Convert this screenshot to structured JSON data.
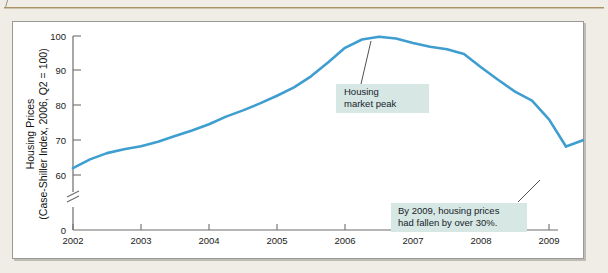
{
  "page": {
    "top_caption": "",
    "background_color": "#efede6",
    "panel_background": "#ffffff",
    "rule_color": "#a89463"
  },
  "chart_data": {
    "type": "line",
    "title": "",
    "xlabel": "",
    "ylabel_line1": "Housing Prices",
    "ylabel_line2": "(Case-Shiller Index, 2006, Q2 = 100)",
    "series_color": "#3f9ed0",
    "grid": false,
    "legend": "none",
    "axis_break": true,
    "axis_break_label": "//",
    "xlim": [
      2002,
      2009.35
    ],
    "ylim": [
      0,
      100
    ],
    "y_ticks": [
      0,
      60,
      70,
      80,
      90,
      100
    ],
    "y_tick_labels": [
      "0",
      "60",
      "70",
      "80",
      "90",
      "100"
    ],
    "x_ticks": [
      2002,
      2003,
      2004,
      2005,
      2006,
      2007,
      2008,
      2009
    ],
    "x_tick_labels": [
      "2002",
      "2003",
      "2004",
      "2005",
      "2006",
      "2007",
      "2008",
      "2009"
    ],
    "x": [
      2002.0,
      2002.25,
      2002.5,
      2002.75,
      2003.0,
      2003.25,
      2003.5,
      2003.75,
      2004.0,
      2004.25,
      2004.5,
      2004.75,
      2005.0,
      2005.25,
      2005.5,
      2005.75,
      2006.0,
      2006.25,
      2006.5,
      2006.75,
      2007.0,
      2007.25,
      2007.5,
      2007.75,
      2008.0,
      2008.25,
      2008.5,
      2008.75,
      2009.0,
      2009.25
    ],
    "values": [
      62.0,
      64.5,
      66.3,
      67.4,
      68.3,
      69.6,
      71.2,
      72.8,
      74.6,
      76.8,
      78.6,
      80.6,
      82.8,
      85.2,
      88.4,
      92.4,
      96.6,
      99.0,
      99.8,
      99.3,
      98.0,
      96.9,
      96.2,
      94.8,
      91.0,
      87.4,
      84.0,
      81.4,
      76.0,
      68.2
    ],
    "values_tail": [
      68.2,
      70.0
    ],
    "annotations": [
      {
        "id": "housing-market-peak",
        "text_lines": [
          "Housing",
          "market peak"
        ],
        "box_color": "#d6e7e4",
        "anchor_x": 2006.35,
        "anchor_y": 99.8
      },
      {
        "id": "decline-note",
        "text_lines": [
          "By 2009, housing prices",
          "had fallen by over 30%."
        ],
        "box_color": "#d6e7e4",
        "anchor_x": 2009.05,
        "anchor_y": 68.2
      }
    ]
  }
}
